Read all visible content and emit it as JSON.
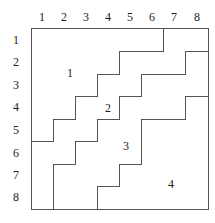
{
  "grid": {
    "columns": [
      "1",
      "2",
      "3",
      "4",
      "5",
      "6",
      "7",
      "8"
    ],
    "rows": [
      "1",
      "2",
      "3",
      "4",
      "5",
      "6",
      "7",
      "8"
    ]
  },
  "regions": [
    {
      "label": "1",
      "x": 70,
      "y": 77
    },
    {
      "label": "2",
      "x": 108,
      "y": 112
    },
    {
      "label": "3",
      "x": 126,
      "y": 150
    },
    {
      "label": "4",
      "x": 171,
      "y": 188
    }
  ],
  "colors": {
    "line": "#555555",
    "text": "#222222",
    "background": "#ffffff"
  }
}
